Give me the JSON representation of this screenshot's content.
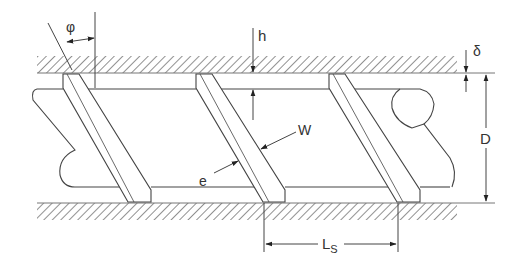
{
  "diagram": {
    "colors": {
      "line": "#444444",
      "hatch": "#555555",
      "background": "#ffffff"
    },
    "barrel": {
      "top_band": {
        "x1": 37,
        "x2": 457,
        "y1": 56,
        "y2": 73
      },
      "bottom_band": {
        "x1": 37,
        "x2": 457,
        "y1": 203,
        "y2": 220
      }
    },
    "screw_root": {
      "top_y": 89,
      "bottom_y": 187
    },
    "flights": [
      {
        "top_x": 63,
        "bottom_x": 128,
        "width": 17
      },
      {
        "top_x": 196,
        "bottom_x": 263,
        "width": 17
      },
      {
        "top_x": 329,
        "bottom_x": 397,
        "width": 17
      }
    ],
    "labels": {
      "phi": "φ",
      "h": "h",
      "delta": "δ",
      "D": "D",
      "W": "W",
      "e": "e",
      "Ls_main": "L",
      "Ls_sub": "S"
    },
    "dimensions": [
      {
        "symbol": "φ",
        "meaning": "helix angle"
      },
      {
        "symbol": "h",
        "meaning": "channel depth"
      },
      {
        "symbol": "δ",
        "meaning": "flight clearance"
      },
      {
        "symbol": "D",
        "meaning": "barrel diameter"
      },
      {
        "symbol": "W",
        "meaning": "channel width"
      },
      {
        "symbol": "e",
        "meaning": "flight width"
      },
      {
        "symbol": "Ls",
        "meaning": "screw lead"
      }
    ]
  }
}
